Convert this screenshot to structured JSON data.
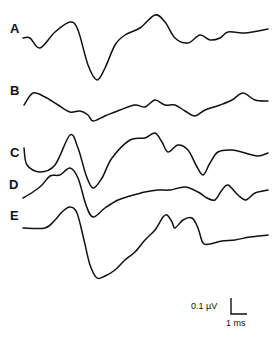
{
  "chart_data": {
    "type": "line",
    "title": "",
    "xlabel": "",
    "ylabel": "",
    "grid": false,
    "legend": "none",
    "series": [
      {
        "name": "A",
        "label": "A",
        "points": [
          [
            23,
            38
          ],
          [
            30,
            38
          ],
          [
            40,
            48
          ],
          [
            55,
            32
          ],
          [
            70,
            22
          ],
          [
            78,
            30
          ],
          [
            88,
            65
          ],
          [
            97,
            80
          ],
          [
            105,
            68
          ],
          [
            115,
            45
          ],
          [
            125,
            35
          ],
          [
            140,
            28
          ],
          [
            155,
            15
          ],
          [
            165,
            22
          ],
          [
            175,
            38
          ],
          [
            188,
            43
          ],
          [
            200,
            35
          ],
          [
            210,
            40
          ],
          [
            220,
            38
          ],
          [
            228,
            32
          ],
          [
            245,
            33
          ],
          [
            258,
            31
          ],
          [
            268,
            29
          ]
        ]
      },
      {
        "name": "B",
        "label": "B",
        "points": [
          [
            24,
            105
          ],
          [
            33,
            93
          ],
          [
            45,
            97
          ],
          [
            58,
            105
          ],
          [
            70,
            112
          ],
          [
            80,
            111
          ],
          [
            88,
            115
          ],
          [
            93,
            121
          ],
          [
            105,
            116
          ],
          [
            120,
            110
          ],
          [
            135,
            105
          ],
          [
            145,
            107
          ],
          [
            155,
            100
          ],
          [
            165,
            105
          ],
          [
            175,
            105
          ],
          [
            185,
            111
          ],
          [
            195,
            116
          ],
          [
            205,
            110
          ],
          [
            220,
            105
          ],
          [
            232,
            100
          ],
          [
            243,
            93
          ],
          [
            255,
            100
          ],
          [
            268,
            101
          ]
        ]
      },
      {
        "name": "C",
        "label": "C",
        "points": [
          [
            24,
            148
          ],
          [
            27,
            165
          ],
          [
            40,
            172
          ],
          [
            55,
            165
          ],
          [
            70,
            135
          ],
          [
            78,
            148
          ],
          [
            86,
            175
          ],
          [
            93,
            188
          ],
          [
            102,
            178
          ],
          [
            112,
            158
          ],
          [
            130,
            140
          ],
          [
            145,
            138
          ],
          [
            155,
            133
          ],
          [
            162,
            142
          ],
          [
            168,
            152
          ],
          [
            178,
            145
          ],
          [
            188,
            150
          ],
          [
            196,
            165
          ],
          [
            203,
            175
          ],
          [
            210,
            163
          ],
          [
            218,
            152
          ],
          [
            232,
            150
          ],
          [
            245,
            153
          ],
          [
            258,
            156
          ],
          [
            268,
            153
          ]
        ]
      },
      {
        "name": "D",
        "label": "D",
        "points": [
          [
            23,
            198
          ],
          [
            33,
            192
          ],
          [
            42,
            185
          ],
          [
            50,
            176
          ],
          [
            60,
            175
          ],
          [
            70,
            168
          ],
          [
            78,
            178
          ],
          [
            86,
            205
          ],
          [
            93,
            217
          ],
          [
            105,
            208
          ],
          [
            118,
            200
          ],
          [
            130,
            196
          ],
          [
            145,
            192
          ],
          [
            158,
            190
          ],
          [
            170,
            190
          ],
          [
            185,
            187
          ],
          [
            198,
            192
          ],
          [
            207,
            198
          ],
          [
            215,
            200
          ],
          [
            222,
            190
          ],
          [
            228,
            185
          ],
          [
            238,
            195
          ],
          [
            246,
            200
          ],
          [
            255,
            193
          ],
          [
            268,
            190
          ]
        ]
      },
      {
        "name": "E",
        "label": "E",
        "points": [
          [
            23,
            228
          ],
          [
            45,
            228
          ],
          [
            55,
            220
          ],
          [
            62,
            212
          ],
          [
            70,
            207
          ],
          [
            77,
            213
          ],
          [
            84,
            240
          ],
          [
            90,
            265
          ],
          [
            97,
            278
          ],
          [
            105,
            276
          ],
          [
            115,
            270
          ],
          [
            125,
            260
          ],
          [
            135,
            252
          ],
          [
            145,
            240
          ],
          [
            155,
            230
          ],
          [
            163,
            217
          ],
          [
            167,
            215
          ],
          [
            172,
            222
          ],
          [
            175,
            228
          ],
          [
            183,
            220
          ],
          [
            192,
            218
          ],
          [
            198,
            228
          ],
          [
            203,
            243
          ],
          [
            210,
            244
          ],
          [
            222,
            241
          ],
          [
            235,
            240
          ],
          [
            250,
            237
          ],
          [
            268,
            235
          ]
        ]
      }
    ],
    "annotations": [
      {
        "text": "0.1 µV",
        "role": "vertical scale bar"
      },
      {
        "text": "1 ms",
        "role": "horizontal scale bar"
      }
    ]
  },
  "labels": {
    "a": "A",
    "b": "B",
    "c": "C",
    "d": "D",
    "e": "E"
  },
  "scale": {
    "voltage": "0.1 µV",
    "time": "1 ms"
  }
}
